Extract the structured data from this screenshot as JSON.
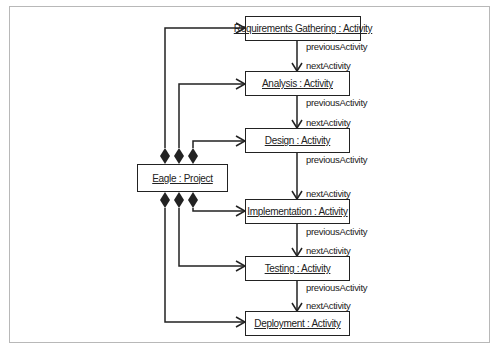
{
  "diagram": {
    "type": "UML object diagram",
    "project": {
      "label": "Eagle : Project"
    },
    "activities": [
      {
        "label": "Requirements Gathering : Activity"
      },
      {
        "label": "Analysis : Activity"
      },
      {
        "label": "Design : Activity"
      },
      {
        "label": "Implementation : Activity"
      },
      {
        "label": "Testing : Activity"
      },
      {
        "label": "Deployment : Activity"
      }
    ],
    "links": [
      {
        "from": "Requirements Gathering : Activity",
        "to": "Analysis : Activity",
        "previous_role": "previousActivity",
        "next_role": "nextActivity"
      },
      {
        "from": "Analysis : Activity",
        "to": "Design : Activity",
        "previous_role": "previousActivity",
        "next_role": "nextActivity"
      },
      {
        "from": "Design : Activity",
        "to": "Implementation : Activity",
        "previous_role": "previousActivity",
        "next_role": "nextActivity"
      },
      {
        "from": "Implementation : Activity",
        "to": "Testing : Activity",
        "previous_role": "previousActivity",
        "next_role": "nextActivity"
      },
      {
        "from": "Testing : Activity",
        "to": "Deployment : Activity",
        "previous_role": "previousActivity",
        "next_role": "nextActivity"
      }
    ],
    "composition": "Eagle : Project composes each Activity (filled diamond at project end, open arrow at activity end)",
    "colors": {
      "line": "#222222",
      "frame": "#b8b8b8",
      "background": "#ffffff"
    }
  }
}
